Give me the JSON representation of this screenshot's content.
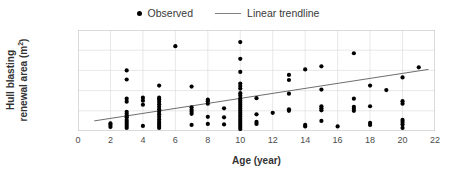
{
  "chart_data": {
    "type": "scatter",
    "title": "",
    "xlabel": "Age (year)",
    "ylabel": "Hull blasting renewal area (m²)",
    "xlim": [
      0,
      22
    ],
    "ylim": [
      0,
      10000
    ],
    "xticks": [
      0,
      2,
      4,
      6,
      8,
      10,
      12,
      14,
      16,
      18,
      20,
      22
    ],
    "yticks": [
      0,
      2000,
      4000,
      6000,
      8000,
      10000
    ],
    "ytick_labels": [
      "0",
      "2,000",
      "4,000",
      "6,000",
      "8,000",
      "10,000"
    ],
    "xtick_labels": [
      "0",
      "2",
      "4",
      "6",
      "8",
      "10",
      "12",
      "14",
      "16",
      "18",
      "20",
      "22"
    ],
    "grid": true,
    "grid_color": "#d9d9d9",
    "legend_position": "top-center",
    "marker_color": "#000000",
    "trendline_color": "#808080",
    "series": [
      {
        "name": "Observed",
        "type": "scatter",
        "marker": "circle",
        "points": [
          [
            2,
            400
          ],
          [
            2,
            600
          ],
          [
            2,
            750
          ],
          [
            3,
            300
          ],
          [
            3,
            500
          ],
          [
            3,
            700
          ],
          [
            3,
            900
          ],
          [
            3,
            1100
          ],
          [
            3,
            1350
          ],
          [
            3,
            1500
          ],
          [
            3,
            1700
          ],
          [
            3,
            1900
          ],
          [
            3,
            2900
          ],
          [
            3,
            3200
          ],
          [
            3,
            5100
          ],
          [
            3,
            6000
          ],
          [
            4,
            500
          ],
          [
            4,
            2600
          ],
          [
            4,
            3000
          ],
          [
            4,
            3300
          ],
          [
            5,
            300
          ],
          [
            5,
            500
          ],
          [
            5,
            700
          ],
          [
            5,
            900
          ],
          [
            5,
            1150
          ],
          [
            5,
            1400
          ],
          [
            5,
            1650
          ],
          [
            5,
            1900
          ],
          [
            5,
            2150
          ],
          [
            5,
            2400
          ],
          [
            5,
            2650
          ],
          [
            5,
            2900
          ],
          [
            5,
            3150
          ],
          [
            5,
            3300
          ],
          [
            5,
            4500
          ],
          [
            6,
            8400
          ],
          [
            7,
            600
          ],
          [
            7,
            1700
          ],
          [
            7,
            1900
          ],
          [
            7,
            2100
          ],
          [
            7,
            2350
          ],
          [
            7,
            4400
          ],
          [
            8,
            700
          ],
          [
            8,
            1400
          ],
          [
            8,
            2700
          ],
          [
            8,
            2950
          ],
          [
            8,
            3100
          ],
          [
            9,
            650
          ],
          [
            9,
            1350
          ],
          [
            9,
            2250
          ],
          [
            10,
            200
          ],
          [
            10,
            400
          ],
          [
            10,
            600
          ],
          [
            10,
            800
          ],
          [
            10,
            1000
          ],
          [
            10,
            1200
          ],
          [
            10,
            1400
          ],
          [
            10,
            1600
          ],
          [
            10,
            1800
          ],
          [
            10,
            2000
          ],
          [
            10,
            2200
          ],
          [
            10,
            2400
          ],
          [
            10,
            2600
          ],
          [
            10,
            2800
          ],
          [
            10,
            3000
          ],
          [
            10,
            3200
          ],
          [
            10,
            3500
          ],
          [
            10,
            3750
          ],
          [
            10,
            4200
          ],
          [
            10,
            4450
          ],
          [
            10,
            4700
          ],
          [
            10,
            5850
          ],
          [
            10,
            7150
          ],
          [
            10,
            8800
          ],
          [
            11,
            700
          ],
          [
            11,
            900
          ],
          [
            11,
            1650
          ],
          [
            11,
            3250
          ],
          [
            12,
            1800
          ],
          [
            13,
            2000
          ],
          [
            13,
            2150
          ],
          [
            13,
            3700
          ],
          [
            13,
            5050
          ],
          [
            13,
            5550
          ],
          [
            14,
            450
          ],
          [
            14,
            600
          ],
          [
            14,
            6100
          ],
          [
            15,
            1000
          ],
          [
            15,
            2050
          ],
          [
            15,
            2250
          ],
          [
            15,
            2450
          ],
          [
            15,
            4100
          ],
          [
            15,
            6400
          ],
          [
            16,
            450
          ],
          [
            17,
            2000
          ],
          [
            17,
            2200
          ],
          [
            17,
            2400
          ],
          [
            17,
            3200
          ],
          [
            17,
            7700
          ],
          [
            18,
            600
          ],
          [
            18,
            800
          ],
          [
            18,
            2450
          ],
          [
            18,
            4500
          ],
          [
            19,
            4050
          ],
          [
            20,
            300
          ],
          [
            20,
            650
          ],
          [
            20,
            900
          ],
          [
            20,
            1100
          ],
          [
            20,
            2700
          ],
          [
            20,
            2950
          ],
          [
            20,
            5300
          ],
          [
            21,
            6300
          ]
        ]
      },
      {
        "name": "Linear trendline",
        "type": "line",
        "endpoints": [
          [
            1,
            1000
          ],
          [
            21.6,
            6100
          ]
        ]
      }
    ]
  },
  "legend": {
    "entries": [
      {
        "label": "Observed",
        "marker": "dot"
      },
      {
        "label": "Linear trendline",
        "marker": "line"
      }
    ]
  },
  "axes": {
    "y_title_line1": "Hull blasting",
    "y_title_line2": "renewal area (m",
    "y_title_sup": "2",
    "y_title_tail": ")",
    "x_title": "Age (year)"
  }
}
